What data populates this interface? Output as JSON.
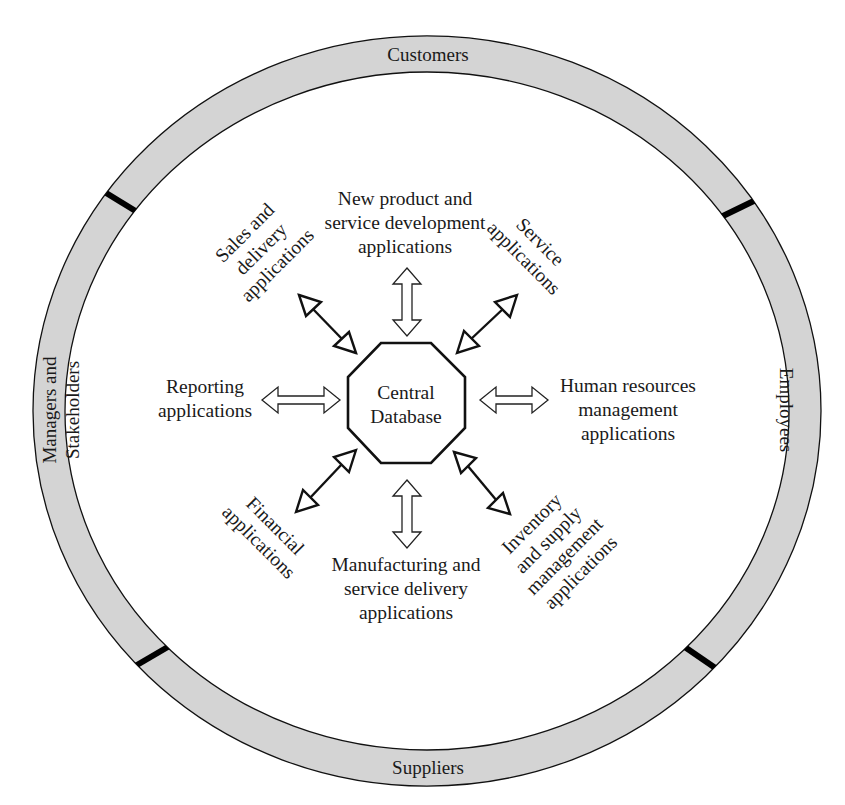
{
  "diagram": {
    "type": "hub-and-spoke",
    "colors": {
      "ring_fill": "#d4d4d4",
      "stroke": "#111111",
      "divider": "#000000",
      "background": "#ffffff"
    },
    "outer_ring": {
      "segments": [
        {
          "id": "top",
          "label": "Customers"
        },
        {
          "id": "right",
          "label": "Employees"
        },
        {
          "id": "bottom",
          "label": "Suppliers"
        },
        {
          "id": "left",
          "label_lines": [
            "Managers and",
            "Stakeholders"
          ]
        }
      ],
      "divider_count": 4
    },
    "hub": {
      "shape": "octagon",
      "label_lines": [
        "Central",
        "Database"
      ]
    },
    "spokes": [
      {
        "id": "top",
        "arrow": "hollow-double",
        "label_lines": [
          "New product and",
          "service development",
          "applications"
        ]
      },
      {
        "id": "top-right",
        "arrow": "line-double",
        "label_lines": [
          "Service",
          "applications"
        ]
      },
      {
        "id": "right",
        "arrow": "hollow-double",
        "label_lines": [
          "Human resources",
          "management",
          "applications"
        ]
      },
      {
        "id": "bottom-right",
        "arrow": "line-double",
        "label_lines": [
          "Inventory",
          "and supply",
          "management",
          "applications"
        ]
      },
      {
        "id": "bottom",
        "arrow": "hollow-double",
        "label_lines": [
          "Manufacturing and",
          "service delivery",
          "applications"
        ]
      },
      {
        "id": "bottom-left",
        "arrow": "line-double",
        "label_lines": [
          "Financial",
          "applications"
        ]
      },
      {
        "id": "left",
        "arrow": "hollow-double",
        "label_lines": [
          "Reporting",
          "applications"
        ]
      },
      {
        "id": "top-left",
        "arrow": "line-double",
        "label_lines": [
          "Sales and",
          "delivery",
          "applications"
        ]
      }
    ]
  }
}
